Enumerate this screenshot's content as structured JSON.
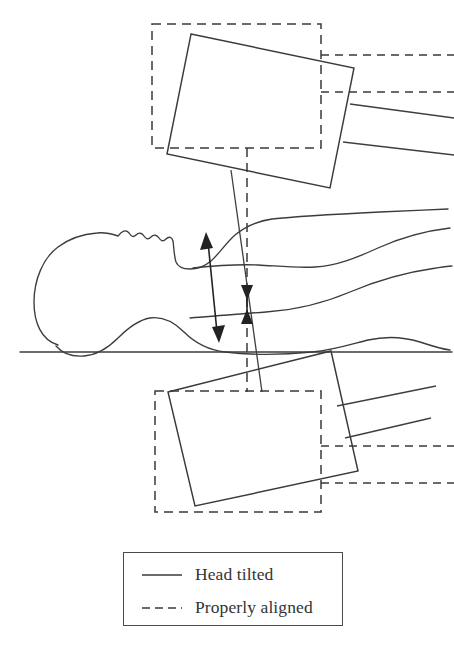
{
  "figure": {
    "kind": "line-diagram"
  },
  "legend": {
    "title": "",
    "items": [
      {
        "id": "head-tilted",
        "label": "Head tilted",
        "line_style": "solid",
        "color": "#3a3a3c"
      },
      {
        "id": "properly-aligned",
        "label": "Properly aligned",
        "line_style": "dashed",
        "color": "#3a3a3c"
      }
    ]
  },
  "annotations": {
    "tilted_offset_arrow": "double-headed tilted measurement arrow",
    "aligned_offset_arrow": "double-headed vertical measurement arrow",
    "baseline": "table surface line"
  },
  "colors": {
    "ink": "#3a3a3c",
    "ink_dark": "#232325",
    "paper": "#ffffff",
    "legend_border": "#4a4a4c"
  },
  "artifact": {
    "bottom_text": ""
  }
}
